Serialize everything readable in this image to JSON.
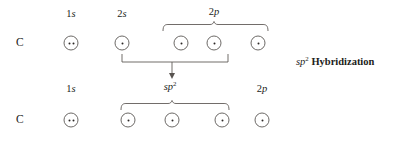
{
  "diagram": {
    "title_note": "sp2 Hybridization",
    "note_italic_part": "sp",
    "note_sup": "2",
    "note_rest": " Hybridization",
    "colors": {
      "ink": "#241f1c",
      "line": "#58534f",
      "circle": "#6d6a67",
      "background": "#ffffff"
    },
    "rows": [
      {
        "id": "ground-state",
        "atom": "C",
        "labels": [
          {
            "id": "label-1s-top",
            "n": "1",
            "l": "s",
            "sup": "",
            "x": 71,
            "y": 8
          },
          {
            "id": "label-2s-top",
            "n": "2",
            "l": "s",
            "sup": "",
            "x": 122,
            "y": 8
          },
          {
            "id": "label-2p-top",
            "n": "2",
            "l": "p",
            "sup": "",
            "x": 214,
            "y": 6
          }
        ],
        "orbitals": [
          {
            "id": "orbital-1s-top",
            "shell": "1s",
            "electrons": 2,
            "x": 71,
            "y": 43
          },
          {
            "id": "orbital-2s-top",
            "shell": "2s",
            "electrons": 1,
            "x": 122,
            "y": 43
          },
          {
            "id": "orbital-2p-x-top",
            "shell": "2p",
            "electrons": 1,
            "x": 181,
            "y": 43
          },
          {
            "id": "orbital-2p-y-top",
            "shell": "2p",
            "electrons": 1,
            "x": 214,
            "y": 43
          },
          {
            "id": "orbital-2p-z-top",
            "shell": "2p",
            "electrons": 1,
            "x": 258,
            "y": 43
          }
        ],
        "brace": {
          "id": "brace-2p-top",
          "left": 163,
          "right": 268,
          "y": 22,
          "tip": 214
        }
      },
      {
        "id": "hybridized-state",
        "atom": "C",
        "labels": [
          {
            "id": "label-1s-bottom",
            "n": "1",
            "l": "s",
            "sup": "",
            "x": 71,
            "y": 83
          },
          {
            "id": "label-sp2-bottom",
            "n": "",
            "l": "sp",
            "sup": "2",
            "x": 170,
            "y": 81
          },
          {
            "id": "label-2p-bottom",
            "n": "2",
            "l": "p",
            "sup": "",
            "x": 262,
            "y": 83
          }
        ],
        "orbitals": [
          {
            "id": "orbital-1s-bottom",
            "shell": "1s",
            "electrons": 2,
            "x": 71,
            "y": 120
          },
          {
            "id": "orbital-sp2-a",
            "shell": "sp2",
            "electrons": 1,
            "x": 128,
            "y": 120
          },
          {
            "id": "orbital-sp2-b",
            "shell": "sp2",
            "electrons": 1,
            "x": 172,
            "y": 120
          },
          {
            "id": "orbital-sp2-c",
            "shell": "sp2",
            "electrons": 1,
            "x": 222,
            "y": 120
          },
          {
            "id": "orbital-2p-bottom",
            "shell": "2p",
            "electrons": 1,
            "x": 262,
            "y": 120
          }
        ],
        "brace": {
          "id": "brace-sp2-bottom",
          "left": 121,
          "right": 229,
          "y": 99,
          "tip": 172
        }
      }
    ],
    "promotion": {
      "id": "hybridization-bracket",
      "left": 122,
      "right": 228,
      "top": 54,
      "bottom": 62,
      "arrow_x": 172,
      "arrow_y_start": 62,
      "arrow_y_end": 76
    }
  }
}
